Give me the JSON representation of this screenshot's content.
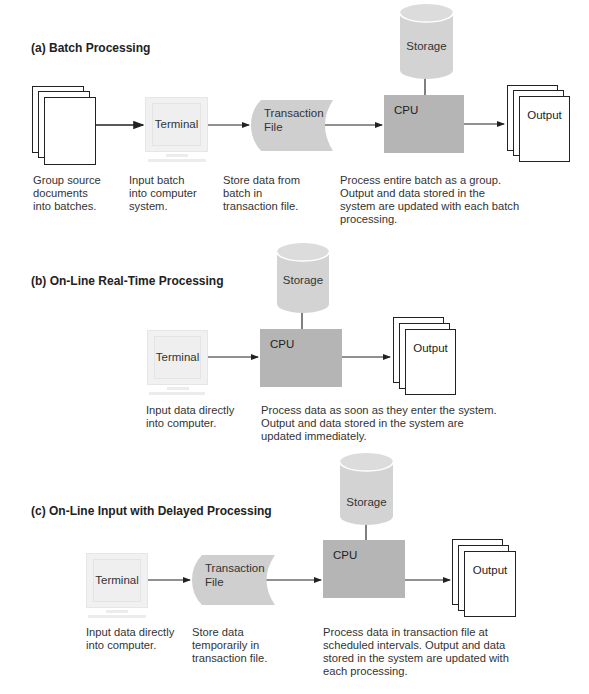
{
  "sections": {
    "batch": {
      "title": "(a) Batch Processing",
      "terminal_label": "Terminal",
      "transaction_label_line1": "Transaction",
      "transaction_label_line2": "File",
      "storage_label": "Storage",
      "cpu_label": "CPU",
      "output_label": "Output",
      "captions": {
        "source_docs": "Group source\ndocuments\ninto batches.",
        "terminal": "Input batch\ninto computer\nsystem.",
        "transaction": "Store data from\nbatch in\ntransaction file.",
        "cpu": "Process entire batch as a group.\nOutput and data stored in the\nsystem are updated with each batch\nprocessing."
      }
    },
    "realtime": {
      "title": "(b) On-Line Real-Time Processing",
      "terminal_label": "Terminal",
      "storage_label": "Storage",
      "cpu_label": "CPU",
      "output_label": "Output",
      "captions": {
        "terminal": "Input data directly\ninto computer.",
        "cpu": "Process data as soon as they enter the system.\nOutput and data stored in the system are\nupdated immediately."
      }
    },
    "delayed": {
      "title": "(c) On-Line Input with Delayed Processing",
      "terminal_label": "Terminal",
      "transaction_label_line1": "Transaction",
      "transaction_label_line2": "File",
      "storage_label": "Storage",
      "cpu_label": "CPU",
      "output_label": "Output",
      "captions": {
        "terminal": "Input data directly\ninto computer.",
        "transaction": "Store data\ntemporarily in\ntransaction file.",
        "cpu": "Process data in transaction file at\nscheduled intervals. Output and data\nstored in the system are updated with\neach processing."
      }
    }
  },
  "colors": {
    "cpu_fill": "#b5b5b5",
    "storage_fill": "#d3d3d3",
    "transaction_fill": "#cfcfcf",
    "terminal_fill": "#f1f1f1",
    "line": "#222222"
  }
}
